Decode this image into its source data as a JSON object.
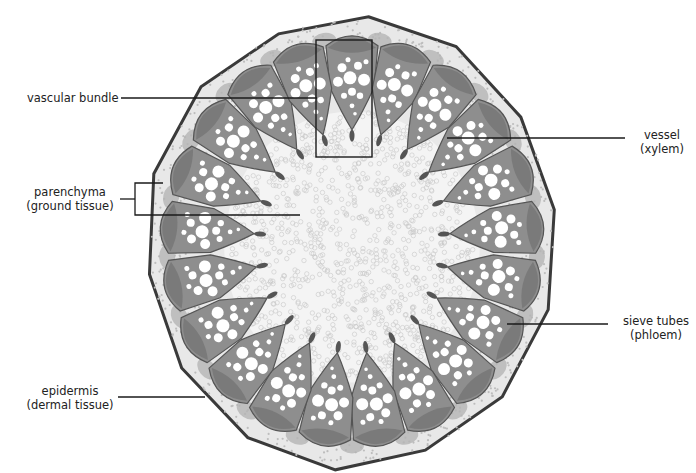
{
  "diagram": {
    "labels": [
      {
        "id": "vascular-bundle",
        "lines": [
          "vascular bundle"
        ],
        "x": 27,
        "y": 91,
        "align": "left"
      },
      {
        "id": "vessel",
        "lines": [
          "vessel",
          "(xylem)"
        ],
        "x": 632,
        "y": 128,
        "align": "center"
      },
      {
        "id": "parenchyma",
        "lines": [
          "parenchyma",
          "(ground tissue)"
        ],
        "x": 20,
        "y": 185,
        "align": "center"
      },
      {
        "id": "sieve-tubes",
        "lines": [
          "sieve tubes",
          "(phloem)"
        ],
        "x": 616,
        "y": 314,
        "align": "center"
      },
      {
        "id": "epidermis",
        "lines": [
          "epidermis",
          "(dermal tissue)"
        ],
        "x": 20,
        "y": 384,
        "align": "center"
      }
    ],
    "leader_lines": [
      {
        "for": "vascular-bundle",
        "points": [
          [
            121,
            98
          ],
          [
            317,
            98
          ]
        ]
      },
      {
        "for": "vessel",
        "points": [
          [
            447,
            138
          ],
          [
            625,
            138
          ]
        ]
      },
      {
        "for": "parenchyma-stub",
        "points": [
          [
            120,
            199
          ],
          [
            135,
            199
          ]
        ]
      },
      {
        "for": "parenchyma-bracket",
        "points": [
          [
            163,
            183
          ],
          [
            135,
            183
          ],
          [
            135,
            215
          ],
          [
            300,
            215
          ]
        ]
      },
      {
        "for": "sieve-tubes",
        "points": [
          [
            507,
            324
          ],
          [
            608,
            324
          ]
        ]
      },
      {
        "for": "epidermis",
        "points": [
          [
            118,
            397
          ],
          [
            205,
            397
          ]
        ]
      }
    ],
    "highlight_box": {
      "for": "vascular-bundle",
      "x": 316,
      "y": 40,
      "width": 56,
      "height": 117
    },
    "section": {
      "center": [
        352,
        242
      ],
      "radius_x": 206,
      "radius_y": 226,
      "bundle_count": 21,
      "colors": {
        "epidermis": "#3a3a3a",
        "cortex": "#e8e8e8",
        "cortex_patch": "#b4b4b4",
        "bundle_cap": "#7a7a7a",
        "bundle_body": "#8e8e8e",
        "xylem_vessel": "#ffffff",
        "pith": "#f4f4f4",
        "pith_cell": "#c8c8c8",
        "line": "#1a1a1a"
      }
    }
  }
}
